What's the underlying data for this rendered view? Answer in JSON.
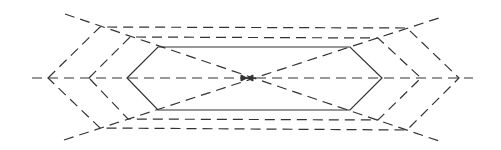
{
  "diagram": {
    "stroke_color": "#333333",
    "background": "#ffffff",
    "center": [
      247,
      78
    ],
    "axis": {
      "x1": 32,
      "x2": 473,
      "y": 78
    },
    "diagonals": [
      {
        "from": [
          65,
          14
        ],
        "to": [
          442,
          142
        ]
      },
      {
        "from": [
          64,
          140
        ],
        "to": [
          442,
          17
        ]
      }
    ],
    "hexagons": [
      {
        "name": "inner",
        "style": "solid",
        "points": [
          [
            127,
            78
          ],
          [
            158,
            47
          ],
          [
            350,
            47
          ],
          [
            382,
            78
          ],
          [
            350,
            110
          ],
          [
            158,
            110
          ]
        ]
      },
      {
        "name": "middle",
        "style": "dashed",
        "points": [
          [
            89,
            78
          ],
          [
            130,
            37
          ],
          [
            378,
            38
          ],
          [
            421,
            78
          ],
          [
            378,
            120
          ],
          [
            128,
            119
          ]
        ]
      },
      {
        "name": "outer",
        "style": "dashed",
        "points": [
          [
            48,
            78
          ],
          [
            100,
            27
          ],
          [
            407,
            28
          ],
          [
            459,
            78
          ],
          [
            407,
            130
          ],
          [
            100,
            128
          ]
        ]
      }
    ]
  }
}
